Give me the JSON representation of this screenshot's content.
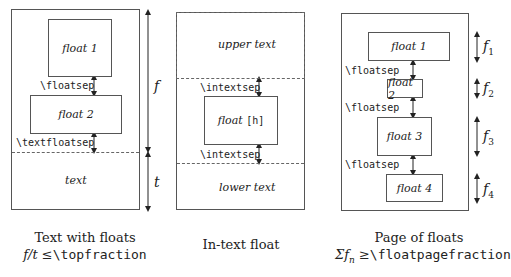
{
  "panels": [
    {
      "id": "text-with-floats",
      "floats": [
        "float 1",
        "float 2"
      ],
      "sep_labels": [
        "\\floatsep",
        "\\textfloatsep"
      ],
      "text_label": "text",
      "dim_labels": [
        "f",
        "t"
      ],
      "caption_line1": "Text with floats",
      "caption_line2_math": "f/t ≤",
      "caption_line2_cmd": "\\topfraction"
    },
    {
      "id": "in-text-float",
      "upper_text": "upper text",
      "float_label": "float",
      "float_option": "[h]",
      "sep_labels": [
        "\\intextsep",
        "\\intextsep"
      ],
      "lower_text": "lower text",
      "caption_line1": "In-text float"
    },
    {
      "id": "page-of-floats",
      "floats": [
        "float 1",
        "float 2",
        "float 3",
        "float 4"
      ],
      "sep_labels": [
        "\\floatsep",
        "\\floatsep",
        "\\floatsep"
      ],
      "dim_labels": [
        "f",
        "f",
        "f",
        "f"
      ],
      "dim_subscripts": [
        "1",
        "2",
        "3",
        "4"
      ],
      "caption_line1": "Page of floats",
      "caption_line2_math": "Σf",
      "caption_line2_sub": "n",
      "caption_line2_rel": " ≥",
      "caption_line2_cmd": "\\floatpagefraction"
    }
  ],
  "colors": {
    "line": "#555555",
    "text": "#222222",
    "background": "#ffffff"
  }
}
